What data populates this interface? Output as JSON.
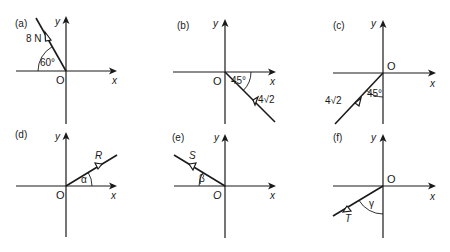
{
  "panels": [
    {
      "id": "a",
      "label": "(a)",
      "x_label": "x",
      "y_label": "y",
      "origin_label": "O",
      "vector_label": "8 N",
      "angle_label": "60°"
    },
    {
      "id": "b",
      "label": "(b)",
      "x_label": "x",
      "y_label": "y",
      "origin_label": "O",
      "vector_label": "4√2",
      "angle_label": "45°"
    },
    {
      "id": "c",
      "label": "(c)",
      "x_label": "x",
      "y_label": "y",
      "origin_label": "O",
      "vector_label": "4√2",
      "angle_label": "45°"
    },
    {
      "id": "d",
      "label": "(d)",
      "x_label": "x",
      "y_label": "y",
      "origin_label": "O",
      "vector_label": "R",
      "angle_label": "α"
    },
    {
      "id": "e",
      "label": "(e)",
      "x_label": "x",
      "y_label": "y",
      "origin_label": "O",
      "vector_label": "S",
      "angle_label": "β"
    },
    {
      "id": "f",
      "label": "(f)",
      "x_label": "x",
      "y_label": "y",
      "origin_label": "O",
      "vector_label": "T",
      "angle_label": "γ"
    }
  ]
}
